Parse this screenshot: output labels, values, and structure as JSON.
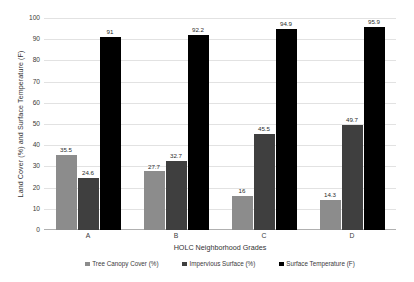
{
  "chart_data": {
    "type": "bar",
    "title": "",
    "xlabel": "HOLC Neighborhood Grades",
    "ylabel": "Land Cover (%) and Surface Temperature (F)",
    "categories": [
      "A",
      "B",
      "C",
      "D"
    ],
    "ylim": [
      0,
      100
    ],
    "yticks": [
      0,
      10,
      20,
      30,
      40,
      50,
      60,
      70,
      80,
      90,
      100
    ],
    "ytick_labels": [
      "0",
      "10",
      "20",
      "30",
      "40",
      "50",
      "60",
      "70",
      "80",
      "90",
      "100"
    ],
    "grid": true,
    "legend_position": "bottom",
    "series": [
      {
        "name": "Tree Canopy Cover (%)",
        "color": "#8c8c8c",
        "values": [
          35.5,
          27.7,
          16,
          14.3
        ],
        "labels": [
          "35.5",
          "27.7",
          "16",
          "14.3"
        ]
      },
      {
        "name": "Impervious Surface (%)",
        "color": "#3f3f3f",
        "values": [
          24.6,
          32.7,
          45.5,
          49.7
        ],
        "labels": [
          "24.6",
          "32.7",
          "45.5",
          "49.7"
        ]
      },
      {
        "name": "Surface Temperature (F)",
        "color": "#000000",
        "values": [
          91,
          92.2,
          94.9,
          95.9
        ],
        "labels": [
          "91",
          "92.2",
          "94.9",
          "95.9"
        ]
      }
    ]
  }
}
